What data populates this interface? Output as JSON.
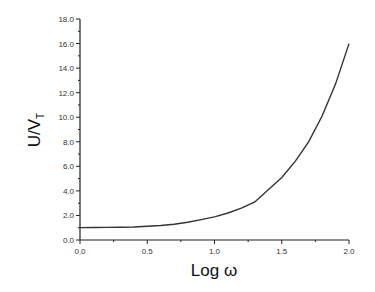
{
  "chart_data": {
    "type": "line",
    "title": "",
    "xlabel": "Log ω",
    "ylabel": "U/V_T",
    "ylabel_main": "U/V",
    "ylabel_sub": "T",
    "xlim": [
      0.0,
      2.0
    ],
    "ylim": [
      0.0,
      18.0
    ],
    "x_ticks": [
      "0.0",
      "0.5",
      "1.0",
      "1.5",
      "2.0"
    ],
    "y_ticks": [
      "0.0",
      "2.0",
      "4.0",
      "6.0",
      "8.0",
      "10.0",
      "12.0",
      "14.0",
      "16.0",
      "18.0"
    ],
    "grid": false,
    "legend": null,
    "series": [
      {
        "name": "U/V_T",
        "color": "#333333",
        "x": [
          0.0,
          0.1,
          0.2,
          0.3,
          0.4,
          0.5,
          0.6,
          0.7,
          0.8,
          0.9,
          1.0,
          1.1,
          1.2,
          1.3,
          1.4,
          1.5,
          1.6,
          1.7,
          1.8,
          1.9,
          2.0
        ],
        "y": [
          1.01,
          1.02,
          1.03,
          1.04,
          1.06,
          1.12,
          1.18,
          1.29,
          1.45,
          1.66,
          1.88,
          2.2,
          2.6,
          3.1,
          4.1,
          5.1,
          6.4,
          8.0,
          10.1,
          12.7,
          16.0
        ]
      }
    ]
  }
}
